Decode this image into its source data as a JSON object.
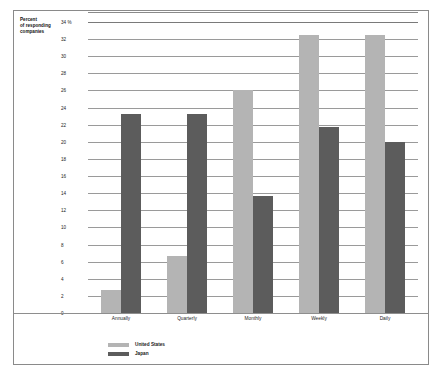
{
  "axis_title": "Percent\nof responding\ncompanies",
  "axis_title_lines": [
    "Percent",
    "of responding",
    "companies"
  ],
  "legend": {
    "items": [
      {
        "label": "United States",
        "color": "#b4b4b4",
        "key": "us"
      },
      {
        "label": "Japan",
        "color": "#5c5c5c",
        "key": "jp"
      }
    ]
  },
  "chart_data": {
    "type": "bar",
    "title": "",
    "subtitle": "",
    "xlabel": "",
    "ylabel": "Percent of responding companies",
    "ylim": [
      0,
      34
    ],
    "ytick_step": 2,
    "ytick_labels": [
      "34 %",
      "32",
      "30",
      "28",
      "26",
      "24",
      "22",
      "20",
      "18",
      "16",
      "14",
      "12",
      "10",
      "8",
      "6",
      "4",
      "2",
      "0"
    ],
    "ytick_values": [
      34,
      32,
      30,
      28,
      26,
      24,
      22,
      20,
      18,
      16,
      14,
      12,
      10,
      8,
      6,
      4,
      2,
      0
    ],
    "grid": true,
    "legend_position": "bottom-left",
    "categories": [
      "Annually",
      "Quarterly",
      "Monthly",
      "Weekly",
      "Daily"
    ],
    "series": [
      {
        "name": "United States",
        "color": "#b4b4b4",
        "values": [
          2.7,
          6.7,
          26.0,
          32.5,
          32.5
        ]
      },
      {
        "name": "Japan",
        "color": "#5c5c5c",
        "values": [
          23.3,
          23.3,
          13.7,
          21.7,
          20.0
        ]
      }
    ]
  }
}
